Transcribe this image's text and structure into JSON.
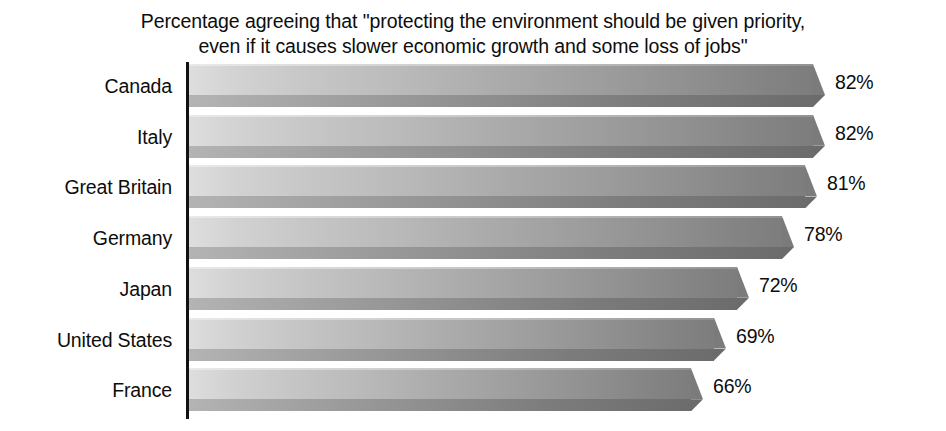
{
  "chart_data": {
    "type": "bar",
    "orientation": "horizontal",
    "title": "Percentage agreeing that \"protecting the environment should be given priority,\neven if it causes slower economic growth and some loss of jobs\"",
    "title_line1": "Percentage agreeing that \"protecting the environment should be given priority,",
    "title_line2": "even if it causes slower economic growth and some loss of jobs\"",
    "subtitle": "",
    "xlabel": "",
    "ylabel": "",
    "categories": [
      "Canada",
      "Italy",
      "Great Britain",
      "Germany",
      "Japan",
      "United States",
      "France"
    ],
    "values": [
      82,
      82,
      81,
      78,
      72,
      69,
      66
    ],
    "value_labels": [
      "82%",
      "82%",
      "81%",
      "78%",
      "72%",
      "69%",
      "66%"
    ],
    "unit": "%",
    "xlim": [
      0,
      88
    ],
    "grid": false,
    "legend": false,
    "legend_position": "none",
    "bar_style": "3d-isometric-gradient",
    "colors": {
      "bar_light": "#dedede",
      "bar_dark": "#7d7d7d",
      "bar_bottom_face": "#8a8a8a",
      "axis": "#111111",
      "text": "#0d0d0d",
      "background": "#ffffff"
    },
    "annotations": []
  },
  "rows": [
    {
      "label": "Canada",
      "value": 82,
      "value_label": "82%"
    },
    {
      "label": "Italy",
      "value": 82,
      "value_label": "82%"
    },
    {
      "label": "Great Britain",
      "value": 81,
      "value_label": "81%"
    },
    {
      "label": "Germany",
      "value": 78,
      "value_label": "78%"
    },
    {
      "label": "Japan",
      "value": 72,
      "value_label": "72%"
    },
    {
      "label": "United States",
      "value": 69,
      "value_label": "69%"
    },
    {
      "label": "France",
      "value": 66,
      "value_label": "66%"
    }
  ]
}
